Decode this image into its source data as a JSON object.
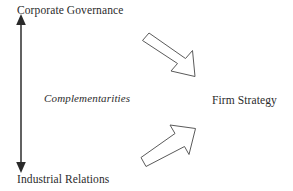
{
  "diagram": {
    "title_alt": "Complementarities between Corporate Governance and Industrial Relations shaping Firm Strategy",
    "labels": {
      "top_axis": "Corporate Governance",
      "bottom_axis": "Industrial Relations",
      "axis_annotation": "Complementarities",
      "outcome": "Firm Strategy"
    },
    "icons": {
      "vertical_double_arrow": "double-headed-vertical-arrow-icon",
      "arrow_top": "block-arrow-down-right-icon",
      "arrow_bottom": "block-arrow-up-right-icon"
    },
    "colors": {
      "background": "#ffffff",
      "text": "#2b2b2b",
      "axis_stroke": "#2a2a2a",
      "block_arrow_stroke": "#5a5a5a",
      "block_arrow_fill": "#ffffff"
    }
  }
}
